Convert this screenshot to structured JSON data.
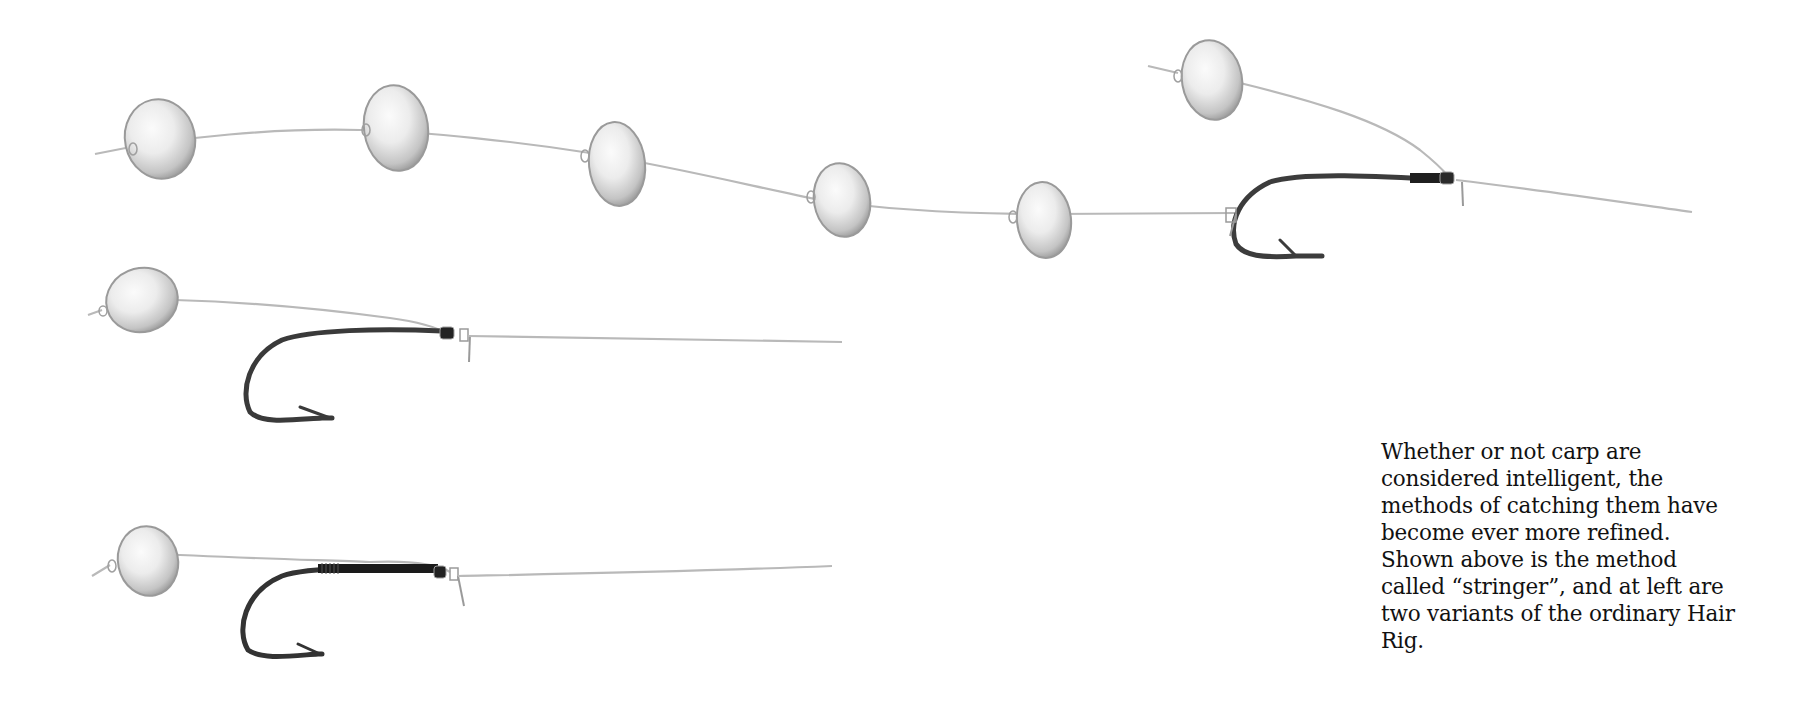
{
  "page": {
    "type": "book-illustration",
    "background": "#ffffff"
  },
  "illustration": {
    "subject": "carp fishing rigs",
    "colors": {
      "line": "#b8b8b8",
      "boilie_fill": "#eeeeee",
      "boilie_shade": "#9a9a9a",
      "hook": "#3a3a3a",
      "whipping": "#1a1a1a"
    },
    "rigs": [
      {
        "name": "stringer",
        "boilie_count": 6,
        "has_hair_boilie": true,
        "hook": true
      },
      {
        "name": "hair-rig-variant-1",
        "boilie_count": 1,
        "hook": true
      },
      {
        "name": "hair-rig-variant-2",
        "boilie_count": 1,
        "hook": true,
        "whipped_shank": true
      }
    ]
  },
  "caption": {
    "lines": [
      "Whether or not carp are",
      "considered intelligent, the",
      "methods of catching them have",
      "become ever more refined.",
      "Shown above is the method",
      "called “stringer”, and at left are",
      "two variants of the ordinary Hair",
      "Rig."
    ]
  }
}
